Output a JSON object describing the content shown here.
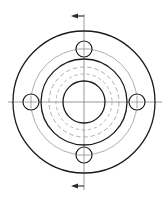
{
  "drawing": {
    "title": "Flange Front View",
    "view_type": "front-view-with-section-indicator",
    "canvas": {
      "width": 168,
      "height": 199
    },
    "center": {
      "x": 84,
      "y": 102
    },
    "colors": {
      "outline": "#1a1a1a",
      "thin": "#555555",
      "hidden_dashed": "#8a8a8a",
      "centerline": "#808080",
      "background": "#ffffff"
    },
    "circles": [
      {
        "name": "outer-rim-circle",
        "radius": 71,
        "style": "solid",
        "weight": 1.3,
        "color": "#1a1a1a"
      },
      {
        "name": "bolt-circle",
        "radius": 53,
        "style": "solid-thin",
        "weight": 0.6,
        "color": "#777777"
      },
      {
        "name": "hub-outer-circle",
        "radius": 43,
        "style": "solid",
        "weight": 1.3,
        "color": "#1a1a1a"
      },
      {
        "name": "hidden-hub-circle",
        "radius": 35,
        "style": "dashed",
        "weight": 0.7,
        "color": "#8a8a8a"
      },
      {
        "name": "hidden-inner-circle",
        "radius": 28,
        "style": "dashed",
        "weight": 0.7,
        "color": "#9a9a9a"
      },
      {
        "name": "center-bore-circle",
        "radius": 21,
        "style": "solid",
        "weight": 1.3,
        "color": "#1a1a1a"
      }
    ],
    "bolt_holes": {
      "count": 4,
      "radius": 8,
      "bolt_circle_radius": 53,
      "crosshair_length": 13,
      "positions": [
        {
          "name": "bolt-hole-top",
          "angle_deg": 90,
          "cx": 84,
          "cy": 49
        },
        {
          "name": "bolt-hole-right",
          "angle_deg": 0,
          "cx": 137,
          "cy": 102
        },
        {
          "name": "bolt-hole-bottom",
          "angle_deg": 270,
          "cx": 84,
          "cy": 155
        },
        {
          "name": "bolt-hole-left",
          "angle_deg": 180,
          "cx": 31,
          "cy": 102
        }
      ]
    },
    "centerlines": [
      {
        "name": "horizontal-centerline",
        "x1": 8,
        "y1": 102,
        "x2": 162,
        "y2": 102
      },
      {
        "name": "vertical-centerline",
        "x1": 84,
        "y1": 14,
        "x2": 84,
        "y2": 190
      }
    ],
    "section_indicators": [
      {
        "name": "section-arrow-top",
        "direction": "left",
        "tail": {
          "x": 84,
          "y": 16
        },
        "elbow": {
          "x": 84,
          "y": 16
        },
        "tip": {
          "x": 71,
          "y": 16
        }
      },
      {
        "name": "section-arrow-bottom",
        "direction": "left",
        "tail": {
          "x": 84,
          "y": 186
        },
        "elbow": {
          "x": 84,
          "y": 186
        },
        "tip": {
          "x": 71,
          "y": 186
        }
      }
    ]
  }
}
